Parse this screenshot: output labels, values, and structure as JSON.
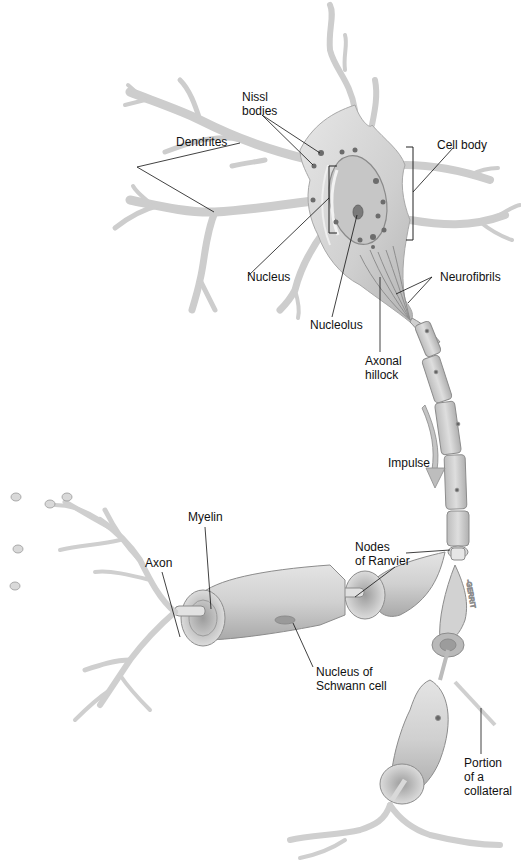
{
  "figure": {
    "labels": {
      "nissl_bodies": "Nissl\nbodies",
      "cell_body": "Cell body",
      "dendrites": "Dendrites",
      "nucleus": "Nucleus",
      "nucleolus": "Nucleolus",
      "neurofibrils": "Neurofibrils",
      "axonal_hillock": "Axonal\nhillock",
      "impulse": "Impulse",
      "myelin": "Myelin",
      "axon": "Axon",
      "nodes_of_ranvier": "Nodes\nof Ranvier",
      "nucleus_of_schwann_cell": "Nucleus of\nSchwann cell",
      "portion_of_collateral": "Portion\nof a\ncollateral"
    },
    "colors": {
      "background": "#ffffff",
      "cell_fill": "#d9d9d9",
      "cell_shade": "#b8b8b8",
      "cell_outline": "#9a9a9a",
      "organelle": "#6a6a6a",
      "leader_line": "#111111"
    }
  }
}
